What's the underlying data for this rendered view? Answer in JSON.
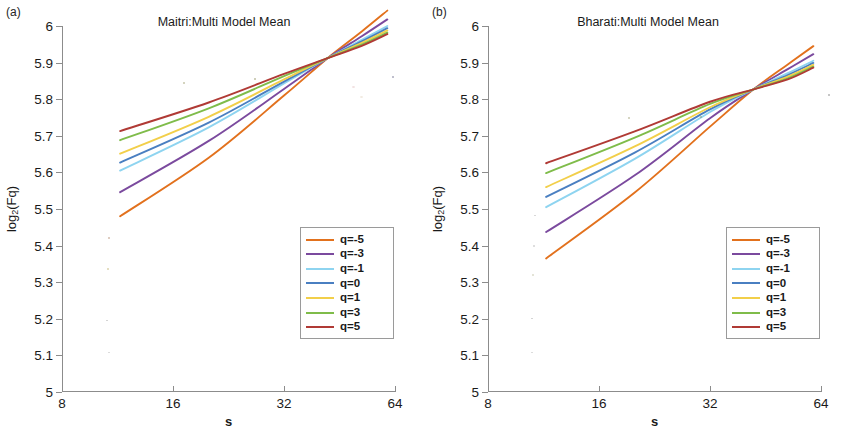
{
  "figure": {
    "width": 852,
    "height": 434,
    "background": "#ffffff"
  },
  "series_colors": {
    "q=-5": "#e2711d",
    "q=-3": "#7b4a9e",
    "q=-1": "#8ed4f0",
    "q=0": "#4a7fc1",
    "q=1": "#f2cf4a",
    "q=3": "#7fbc4a",
    "q=5": "#b03a35"
  },
  "legend": {
    "entries": [
      {
        "label": "q=-5",
        "color": "#e2711d"
      },
      {
        "label": "q=-3",
        "color": "#7b4a9e"
      },
      {
        "label": "q=-1",
        "color": "#8ed4f0"
      },
      {
        "label": "q=0",
        "color": "#4a7fc1"
      },
      {
        "label": "q=1",
        "color": "#f2cf4a"
      },
      {
        "label": "q=3",
        "color": "#7fbc4a"
      },
      {
        "label": "q=5",
        "color": "#b03a35"
      }
    ],
    "position": "lower-right"
  },
  "panels": [
    {
      "tag": "(a)",
      "title": "Maitri:Multi Model Mean"
    },
    {
      "tag": "(b)",
      "title": "Bharati:Multi Model Mean"
    }
  ],
  "axes": {
    "xlabel": "s",
    "ylabel_main": "log",
    "ylabel_sub": "2",
    "ylabel_tail": "(Fq)",
    "ylabel_full": "log2(Fq)",
    "xticks": [
      "8",
      "16",
      "32",
      "64"
    ],
    "xtick_values": [
      8,
      16,
      32,
      64
    ],
    "xscale": "log2",
    "xlim": [
      8,
      64
    ],
    "yticks": [
      "5",
      "5.1",
      "5.2",
      "5.3",
      "5.4",
      "5.5",
      "5.6",
      "5.7",
      "5.8",
      "5.9",
      "6"
    ],
    "ytick_values": [
      5,
      5.1,
      5.2,
      5.3,
      5.4,
      5.5,
      5.6,
      5.7,
      5.8,
      5.9,
      6
    ],
    "ylim": [
      5,
      6
    ],
    "grid": false
  },
  "chart_data": [
    {
      "type": "line",
      "title": "Maitri:Multi Model Mean",
      "panel_tag": "(a)",
      "xlabel": "s",
      "ylabel": "log2(Fq)",
      "xscale": "log2",
      "xlim": [
        8,
        64
      ],
      "ylim": [
        5,
        6
      ],
      "grid": false,
      "legend": "lower-right",
      "x": [
        11.5,
        20,
        32,
        42,
        52,
        61
      ],
      "series": [
        {
          "name": "q=-5",
          "color": "#e2711d",
          "values": [
            5.48,
            5.64,
            5.81,
            5.912,
            5.985,
            6.042
          ]
        },
        {
          "name": "q=-3",
          "color": "#7b4a9e",
          "values": [
            5.546,
            5.686,
            5.828,
            5.912,
            5.972,
            6.018
          ]
        },
        {
          "name": "q=-1",
          "color": "#8ed4f0",
          "values": [
            5.605,
            5.723,
            5.843,
            5.912,
            5.962,
            6.0
          ]
        },
        {
          "name": "q=0",
          "color": "#4a7fc1",
          "values": [
            5.627,
            5.736,
            5.848,
            5.912,
            5.958,
            5.994
          ]
        },
        {
          "name": "q=1",
          "color": "#f2cf4a",
          "values": [
            5.651,
            5.752,
            5.854,
            5.912,
            5.954,
            5.988
          ]
        },
        {
          "name": "q=3",
          "color": "#7fbc4a",
          "values": [
            5.688,
            5.775,
            5.863,
            5.912,
            5.949,
            5.982
          ]
        },
        {
          "name": "q=5",
          "color": "#b03a35",
          "values": [
            5.713,
            5.791,
            5.869,
            5.912,
            5.946,
            5.978
          ]
        }
      ]
    },
    {
      "type": "line",
      "title": "Bharati:Multi Model Mean",
      "panel_tag": "(b)",
      "xlabel": "s",
      "ylabel": "log2(Fq)",
      "xscale": "log2",
      "xlim": [
        8,
        64
      ],
      "ylim": [
        5,
        6
      ],
      "grid": false,
      "legend": "lower-right",
      "x": [
        11.5,
        20,
        32,
        42,
        52,
        61
      ],
      "series": [
        {
          "name": "q=-5",
          "color": "#e2711d",
          "values": [
            5.365,
            5.545,
            5.725,
            5.827,
            5.895,
            5.945
          ]
        },
        {
          "name": "q=-3",
          "color": "#7b4a9e",
          "values": [
            5.437,
            5.592,
            5.748,
            5.827,
            5.882,
            5.923
          ]
        },
        {
          "name": "q=-1",
          "color": "#8ed4f0",
          "values": [
            5.505,
            5.637,
            5.765,
            5.827,
            5.871,
            5.905
          ]
        },
        {
          "name": "q=0",
          "color": "#4a7fc1",
          "values": [
            5.533,
            5.654,
            5.772,
            5.827,
            5.866,
            5.899
          ]
        },
        {
          "name": "q=1",
          "color": "#f2cf4a",
          "values": [
            5.56,
            5.671,
            5.778,
            5.827,
            5.862,
            5.894
          ]
        },
        {
          "name": "q=3",
          "color": "#7fbc4a",
          "values": [
            5.598,
            5.695,
            5.787,
            5.827,
            5.857,
            5.889
          ]
        },
        {
          "name": "q=5",
          "color": "#b03a35",
          "values": [
            5.625,
            5.712,
            5.793,
            5.827,
            5.854,
            5.886
          ]
        }
      ]
    }
  ]
}
